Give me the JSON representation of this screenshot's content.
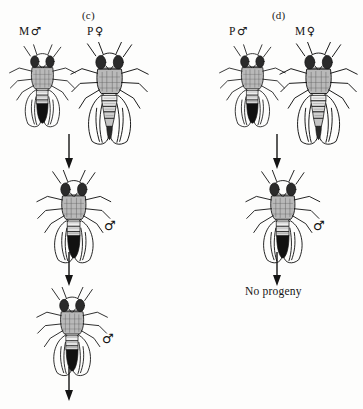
{
  "figure": {
    "background_color": "#fdfdfc",
    "ink_color": "#141414",
    "panels": [
      {
        "id": "c",
        "label": "(c)",
        "parents": [
          {
            "strain": "M",
            "sex": "male",
            "sex_symbol": "♂",
            "label_text": "M"
          },
          {
            "strain": "P",
            "sex": "female",
            "sex_symbol": "♀",
            "label_text": "P"
          }
        ],
        "generations": [
          {
            "name": "F1",
            "sex_symbol": "♂",
            "result": "progeny"
          },
          {
            "name": "F2",
            "sex_symbol": "♂",
            "result": "progeny"
          }
        ],
        "terminal": "arrow"
      },
      {
        "id": "d",
        "label": "(d)",
        "parents": [
          {
            "strain": "P",
            "sex": "male",
            "sex_symbol": "♂",
            "label_text": "P"
          },
          {
            "strain": "M",
            "sex": "female",
            "sex_symbol": "♀",
            "label_text": "M"
          }
        ],
        "generations": [
          {
            "name": "F1",
            "sex_symbol": "♂",
            "result": "progeny"
          }
        ],
        "terminal": "No progeny"
      }
    ]
  },
  "panel_c": {
    "caption": "(c)",
    "parent_male_strain": "M",
    "parent_male_symbol": "♂",
    "parent_female_strain": "P",
    "parent_female_symbol": "♀",
    "f1_symbol": "♂",
    "f2_symbol": "♂"
  },
  "panel_d": {
    "caption": "(d)",
    "parent_male_strain": "P",
    "parent_male_symbol": "♂",
    "parent_female_strain": "M",
    "parent_female_symbol": "♀",
    "f1_symbol": "♂",
    "outcome": "No progeny"
  }
}
